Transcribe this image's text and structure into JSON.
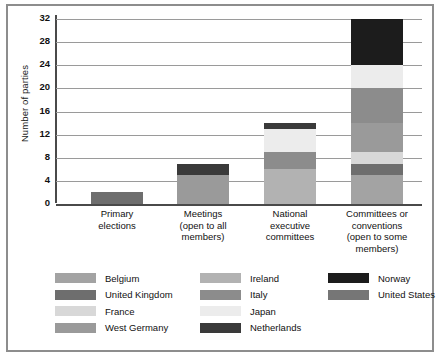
{
  "chart_data": {
    "type": "bar",
    "subtype": "stacked-vertical",
    "title": "",
    "xlabel": "",
    "ylabel": "Number of parties",
    "ylim": [
      0,
      32
    ],
    "ytick_step": 4,
    "yticks": [
      "0",
      "4",
      "8",
      "12",
      "16",
      "20",
      "24",
      "28",
      "32"
    ],
    "grid": true,
    "legend_position": "bottom",
    "categories": [
      "Primary elections",
      "Meetings (open to all members)",
      "National executive committees",
      "Committees or conventions (open to some members)"
    ],
    "category_lines": [
      [
        "Primary",
        "elections"
      ],
      [
        "Meetings",
        "(open to all",
        "members)"
      ],
      [
        "National",
        "executive",
        "committees"
      ],
      [
        "Committees or",
        "conventions",
        "(open to some",
        "members)"
      ]
    ],
    "series": [
      {
        "name": "Belgium",
        "color": "#a3a3a3",
        "values": [
          0,
          0,
          0,
          5
        ]
      },
      {
        "name": "United Kingdom",
        "color": "#6e6e6e",
        "values": [
          2,
          0,
          0,
          2
        ]
      },
      {
        "name": "France",
        "color": "#d8d8d8",
        "values": [
          0,
          0,
          0,
          2
        ]
      },
      {
        "name": "West Germany",
        "color": "#9a9a9a",
        "values": [
          0,
          5,
          0,
          5
        ]
      },
      {
        "name": "Ireland",
        "color": "#b2b2b2",
        "values": [
          0,
          0,
          6,
          0
        ]
      },
      {
        "name": "Italy",
        "color": "#8c8c8c",
        "values": [
          0,
          0,
          3,
          6
        ]
      },
      {
        "name": "Japan",
        "color": "#ececec",
        "values": [
          0,
          0,
          4,
          4
        ]
      },
      {
        "name": "Netherlands",
        "color": "#3a3a3a",
        "values": [
          0,
          2,
          1,
          0
        ]
      },
      {
        "name": "Norway",
        "color": "#1c1c1c",
        "values": [
          0,
          0,
          0,
          8
        ]
      },
      {
        "name": "United States",
        "color": "#767676",
        "values": [
          0,
          0,
          0,
          0
        ]
      }
    ],
    "totals": [
      2,
      7,
      14,
      32
    ]
  },
  "legend": {
    "columns": [
      [
        {
          "label": "Belgium",
          "color": "#a3a3a3"
        },
        {
          "label": "United Kingdom",
          "color": "#6e6e6e"
        },
        {
          "label": "France",
          "color": "#d8d8d8"
        },
        {
          "label": "West Germany",
          "color": "#9a9a9a"
        }
      ],
      [
        {
          "label": "Ireland",
          "color": "#b2b2b2"
        },
        {
          "label": "Italy",
          "color": "#8c8c8c"
        },
        {
          "label": "Japan",
          "color": "#ececec"
        },
        {
          "label": "Netherlands",
          "color": "#3a3a3a"
        }
      ],
      [
        {
          "label": "Norway",
          "color": "#1c1c1c"
        },
        {
          "label": "United States",
          "color": "#767676"
        }
      ]
    ]
  },
  "style": {
    "border_color": "#8d8d8d",
    "gridline_color": "#9a9a9a",
    "axis_color": "#4a4a4a",
    "background": "#ffffff"
  }
}
